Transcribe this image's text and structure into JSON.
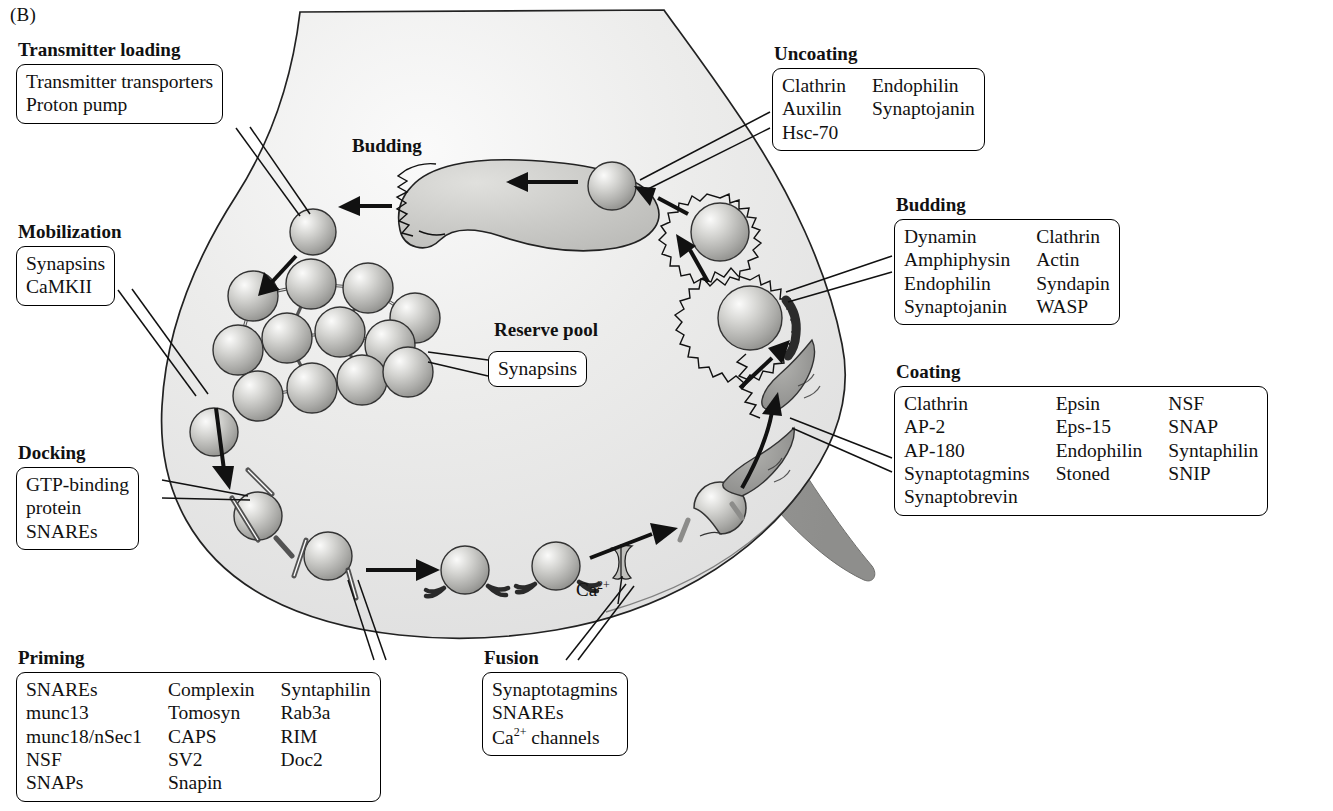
{
  "figure": {
    "panel_letter": "(B)",
    "inner_labels": [
      {
        "name": "budding-inner-label",
        "text": "Budding",
        "x": 352,
        "y": 135
      },
      {
        "name": "reserve-pool-label",
        "text": "Reserve pool",
        "x": 494,
        "y": 319
      }
    ],
    "ion_label": {
      "name": "calcium-label",
      "text": "Ca",
      "sup": "2+",
      "x": 576,
      "y": 580
    }
  },
  "callouts": [
    {
      "id": "transmitter-loading",
      "caption": "Transmitter loading",
      "columns": [
        [
          "Transmitter transporters",
          "Proton pump"
        ]
      ],
      "x": 16,
      "y": 40
    },
    {
      "id": "mobilization",
      "caption": "Mobilization",
      "columns": [
        [
          "Synapsins",
          "CaMKII"
        ]
      ],
      "x": 16,
      "y": 222
    },
    {
      "id": "docking",
      "caption": "Docking",
      "columns": [
        [
          "GTP-binding",
          "protein",
          "SNAREs"
        ]
      ],
      "x": 16,
      "y": 443
    },
    {
      "id": "priming",
      "caption": "Priming",
      "columns": [
        [
          "SNAREs",
          "munc13",
          "munc18/nSec1",
          "NSF",
          "SNAPs"
        ],
        [
          "Complexin",
          "Tomosyn",
          "CAPS",
          "SV2",
          "Snapin"
        ],
        [
          "Syntaphilin",
          "Rab3a",
          "RIM",
          "Doc2"
        ]
      ],
      "x": 16,
      "y": 648
    },
    {
      "id": "fusion",
      "caption": "Fusion",
      "columns": [
        [
          "Synaptotagmins",
          "SNAREs",
          "Ca2+ channels"
        ]
      ],
      "x": 482,
      "y": 648
    },
    {
      "id": "uncoating",
      "caption": "Uncoating",
      "columns": [
        [
          "Clathrin",
          "Auxilin",
          "Hsc-70"
        ],
        [
          "Endophilin",
          "Synaptojanin"
        ]
      ],
      "x": 772,
      "y": 44
    },
    {
      "id": "budding",
      "caption": "Budding",
      "columns": [
        [
          "Dynamin",
          "Amphiphysin",
          "Endophilin",
          "Synaptojanin"
        ],
        [
          "Clathrin",
          "Actin",
          "Syndapin",
          "WASP"
        ]
      ],
      "x": 894,
      "y": 195
    },
    {
      "id": "coating",
      "caption": "Coating",
      "columns": [
        [
          "Clathrin",
          "AP-2",
          "AP-180",
          "Synaptotagmins",
          "Synaptobrevin"
        ],
        [
          "Epsin",
          "Eps-15",
          "Endophilin",
          "Stoned"
        ],
        [
          "NSF",
          "SNAP",
          "Syntaphilin",
          "SNIP"
        ]
      ],
      "x": 894,
      "y": 362
    }
  ],
  "colors": {
    "ink": "#111111",
    "terminal_fill_light": "#e8e8e6",
    "terminal_fill_mid": "#dcdcd9",
    "postsynaptic_band": "#9a9a9a",
    "vesicle_light": "#f2f2f0",
    "vesicle_mid": "#b9b9b6",
    "vesicle_dark": "#8d8d8a",
    "endosome_fill": "#c9c9c6",
    "dynamin_collar": "#3a3a3a"
  },
  "diagram_elements": {
    "reserve_pool_vesicle_count": 11,
    "docked_vesicle_count": 2,
    "primed_vesicle_count": 2,
    "coated_vesicle_count": 2,
    "uncoated_vesicle_count": 2,
    "endosome_label": "endosome",
    "calcium_channel_count": 1
  }
}
